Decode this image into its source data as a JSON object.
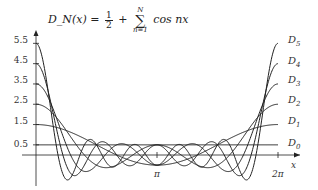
{
  "chart_data": {
    "type": "line",
    "formula": {
      "lhs": "D_N(x) =",
      "frac_num": "1",
      "frac_den": "2",
      "plus": "+",
      "sum_upper": "N",
      "sum_lower": "n=1",
      "term": "cos nx"
    },
    "xlabel": "x",
    "ylabel": "",
    "x_range": [
      0,
      6.2832
    ],
    "y_range": [
      -1.2,
      5.8
    ],
    "xticks": [
      {
        "value": 3.1416,
        "label": "π"
      },
      {
        "value": 6.2832,
        "label": "2π"
      }
    ],
    "yticks": [
      {
        "value": 0.5,
        "label": "0.5"
      },
      {
        "value": 1.5,
        "label": "1.5"
      },
      {
        "value": 2.5,
        "label": "2.5"
      },
      {
        "value": 3.5,
        "label": "3.5"
      },
      {
        "value": 4.5,
        "label": "4.5"
      },
      {
        "value": 5.5,
        "label": "5.5"
      }
    ],
    "grid": false,
    "legend_position": "right-inline",
    "series": [
      {
        "name": "D0",
        "label_main": "D",
        "label_sub": "0",
        "N": 0,
        "value_at_0": 0.5
      },
      {
        "name": "D1",
        "label_main": "D",
        "label_sub": "1",
        "N": 1,
        "value_at_0": 1.5
      },
      {
        "name": "D2",
        "label_main": "D",
        "label_sub": "2",
        "N": 2,
        "value_at_0": 2.5
      },
      {
        "name": "D3",
        "label_main": "D",
        "label_sub": "3",
        "N": 3,
        "value_at_0": 3.5
      },
      {
        "name": "D4",
        "label_main": "D",
        "label_sub": "4",
        "N": 4,
        "value_at_0": 4.5
      },
      {
        "name": "D5",
        "label_main": "D",
        "label_sub": "5",
        "N": 5,
        "value_at_0": 5.5
      }
    ],
    "line_color": "#222222"
  }
}
